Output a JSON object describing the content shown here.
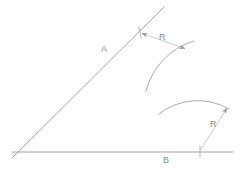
{
  "figure": {
    "background_color": "#ffffff",
    "stroke_color": "#9a9a9a",
    "light_stroke_color": "#bcbcbc",
    "text_color": "#8c8c8c",
    "width": 243,
    "height": 177
  },
  "labels": {
    "line_a": "A",
    "line_b": "B",
    "radius_top": "R",
    "radius_bottom": "R"
  },
  "geometry": {
    "vertex": {
      "x": 18,
      "y": 152
    },
    "line_a": {
      "name": "A",
      "start": {
        "x": 12,
        "y": 158
      },
      "end": {
        "x": 164,
        "y": 7
      }
    },
    "line_b": {
      "name": "B",
      "start": {
        "x": 12,
        "y": 152
      },
      "end": {
        "x": 233,
        "y": 152
      }
    },
    "tick_on_a": {
      "x": 140,
      "y": 32
    },
    "tick_on_b": {
      "x": 200,
      "y": 152
    },
    "arc_top": {
      "start": {
        "x": 146,
        "y": 91
      },
      "end": {
        "x": 194,
        "y": 41
      },
      "radius": 70,
      "sweep": 1
    },
    "arc_bottom": {
      "start": {
        "x": 159,
        "y": 114
      },
      "end": {
        "x": 229,
        "y": 109
      },
      "radius": 62,
      "sweep": 1
    },
    "dimension_top": {
      "from": {
        "x": 141,
        "y": 33
      },
      "to": {
        "x": 186,
        "y": 49
      },
      "label": "R"
    },
    "dimension_bottom": {
      "from": {
        "x": 200,
        "y": 151
      },
      "to": {
        "x": 228,
        "y": 107
      },
      "label": "R"
    },
    "center_mark_top": {
      "x": 148,
      "y": 92
    },
    "center_mark_bottom": {
      "x": 161,
      "y": 114
    }
  }
}
